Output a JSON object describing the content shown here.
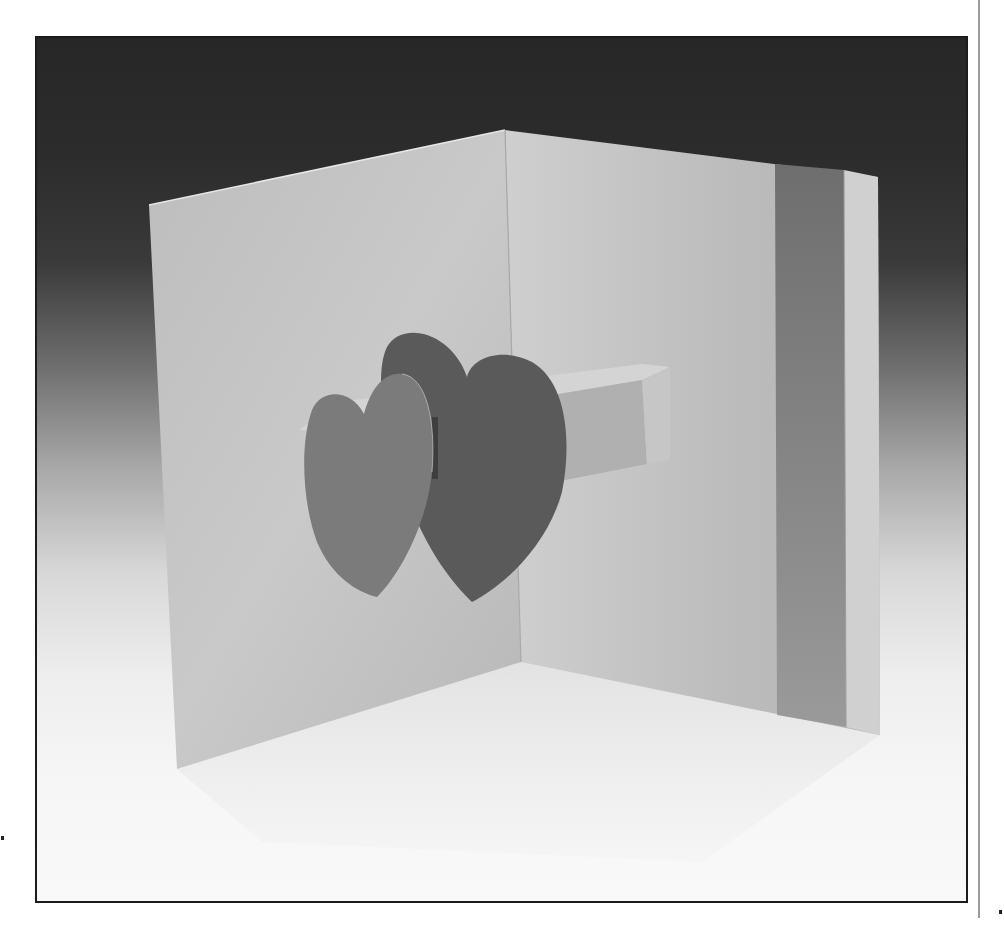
{
  "image": {
    "subject": "Pop-up greeting card with two heart cut-outs",
    "description": "Black-and-white photograph of an open folded card standing at a right angle; two overlapping hearts pop out on a paper beam between the panels; a darker vertical band runs down the right panel.",
    "colors": {
      "background_top": "#272727",
      "background_bottom": "#f9f9f9",
      "left_panel": "#c4c4c4",
      "right_panel": "#bdbdbd",
      "band": "#858585",
      "back_heart": "#5a5a5a",
      "front_heart": "#7b7b7b",
      "beam": "#b2b2b2",
      "frame_border": "#1c1c1c"
    }
  }
}
